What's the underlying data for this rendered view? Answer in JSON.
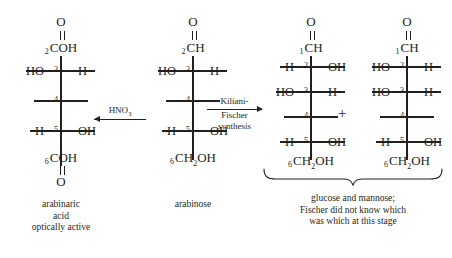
{
  "diagram": {
    "ink_color": "#231f20",
    "background_color": "#ffffff"
  },
  "structures": [
    {
      "id": "arabinaric-acid",
      "top_oxygen": "O",
      "top_group": {
        "locant": "2",
        "formula": "COH"
      },
      "centers": [
        {
          "locant": "3",
          "left": "HO",
          "right": "H"
        },
        {
          "locant": "4",
          "left": "",
          "right": ""
        },
        {
          "locant": "5",
          "left": "H",
          "right": "OH"
        }
      ],
      "bottom_group": {
        "locant": "6",
        "formula": "COH"
      },
      "bottom_oxygen": "O",
      "caption": [
        "arabinaric",
        "acid",
        "optically active"
      ]
    },
    {
      "id": "arabinose",
      "top_oxygen": "O",
      "top_group": {
        "locant": "2",
        "formula": "CH"
      },
      "centers": [
        {
          "locant": "3",
          "left": "HO",
          "right": "H"
        },
        {
          "locant": "4",
          "left": "",
          "right": ""
        },
        {
          "locant": "5",
          "left": "H",
          "right": "OH"
        }
      ],
      "bottom_group": {
        "locant": "6",
        "formula": "CH2OH"
      },
      "bottom_oxygen": "",
      "caption": [
        "arabinose"
      ]
    },
    {
      "id": "glucose",
      "top_oxygen": "O",
      "top_group": {
        "locant": "1",
        "formula": "CH"
      },
      "centers": [
        {
          "locant": "2",
          "left": "H",
          "right": "OH"
        },
        {
          "locant": "3",
          "left": "HO",
          "right": "H"
        },
        {
          "locant": "4",
          "left": "",
          "right": ""
        },
        {
          "locant": "5",
          "left": "H",
          "right": "OH"
        }
      ],
      "bottom_group": {
        "locant": "6",
        "formula": "CH2OH"
      },
      "bottom_oxygen": "",
      "caption": []
    },
    {
      "id": "mannose",
      "top_oxygen": "O",
      "top_group": {
        "locant": "1",
        "formula": "CH"
      },
      "centers": [
        {
          "locant": "2",
          "left": "HO",
          "right": "H"
        },
        {
          "locant": "3",
          "left": "HO",
          "right": "H"
        },
        {
          "locant": "4",
          "left": "",
          "right": ""
        },
        {
          "locant": "5",
          "left": "H",
          "right": "OH"
        }
      ],
      "bottom_group": {
        "locant": "6",
        "formula": "CH2OH"
      },
      "bottom_oxygen": "",
      "caption": []
    }
  ],
  "arrows": [
    {
      "id": "hno3-arrow",
      "direction": "left",
      "label_lines": [
        "HNO3"
      ],
      "reagent_formula": "HNO",
      "reagent_subscript": "3"
    },
    {
      "id": "kiliani-fischer-arrow",
      "direction": "right",
      "label_lines": [
        "Kiliani-",
        "Fischer",
        "synthesis"
      ]
    }
  ],
  "plus_sign": "+",
  "product_caption": [
    "glucose and mannose;",
    "Fischer did not know which",
    "was which at this stage"
  ]
}
